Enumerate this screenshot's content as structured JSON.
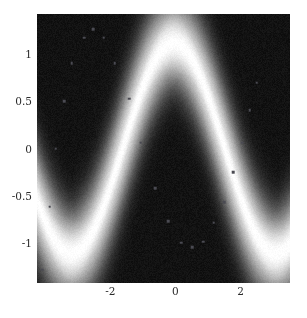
{
  "chart_data": {
    "type": "heatmap",
    "title": "",
    "subtitle": "",
    "xlabel": "",
    "ylabel": "",
    "xlim": [
      -4.25,
      3.52
    ],
    "ylim": [
      -1.43,
      1.43
    ],
    "grid": false,
    "legend": "none",
    "colormap": "grayscale",
    "colormap_low_color": "#000000",
    "colormap_high_color": "#ffffff",
    "x_ticks": [
      {
        "value": -2,
        "label": "-2"
      },
      {
        "value": 0,
        "label": "0"
      },
      {
        "value": 2,
        "label": "2"
      }
    ],
    "y_ticks": [
      {
        "value": 1,
        "label": "1"
      },
      {
        "value": 0.5,
        "label": "0.5"
      },
      {
        "value": 0,
        "label": "0"
      },
      {
        "value": -0.5,
        "label": "-0.5"
      },
      {
        "value": -1,
        "label": "-1"
      }
    ],
    "ridge_function": "y = sin(x + 1.62)",
    "ridge_amplitude": 1.12,
    "ridge_phase": 1.62,
    "ridge_width": 0.3,
    "series": [
      {
        "name": "samples",
        "marker": "square",
        "marker_color": "#4a4a52",
        "points": [
          {
            "x": -4.09,
            "y": -1.29
          },
          {
            "x": -3.86,
            "y": -0.62
          },
          {
            "x": -3.67,
            "y": 0.0
          },
          {
            "x": -3.42,
            "y": 0.5
          },
          {
            "x": -3.18,
            "y": 0.91
          },
          {
            "x": -2.8,
            "y": 1.18
          },
          {
            "x": -2.52,
            "y": 1.27
          },
          {
            "x": -2.2,
            "y": 1.18
          },
          {
            "x": -1.86,
            "y": 0.91
          },
          {
            "x": -1.42,
            "y": 0.53
          },
          {
            "x": -1.06,
            "y": 0.06
          },
          {
            "x": -0.62,
            "y": -0.42
          },
          {
            "x": -0.22,
            "y": -0.77
          },
          {
            "x": 0.18,
            "y": -1.0
          },
          {
            "x": 0.52,
            "y": -1.05
          },
          {
            "x": 0.86,
            "y": -0.99
          },
          {
            "x": 1.18,
            "y": -0.79
          },
          {
            "x": 1.5,
            "y": -0.57
          },
          {
            "x": 1.78,
            "y": -0.25
          },
          {
            "x": 2.06,
            "y": 0.06
          },
          {
            "x": 2.28,
            "y": 0.41
          },
          {
            "x": 2.5,
            "y": 0.7
          }
        ]
      }
    ]
  }
}
